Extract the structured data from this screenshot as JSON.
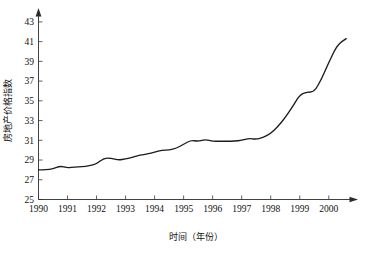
{
  "chart_data": {
    "type": "line",
    "title": "",
    "xlabel": "时间（年份）",
    "ylabel": "房地产价格指数",
    "xlim": [
      1990,
      2000.8
    ],
    "ylim": [
      25,
      43.8
    ],
    "grid": false,
    "legend": null,
    "x_tick_labels": [
      "1990",
      "1991",
      "1992",
      "1993",
      "1994",
      "1995",
      "1996",
      "1997",
      "1998",
      "1999",
      "2000"
    ],
    "x_ticks": [
      1990,
      1991,
      1992,
      1993,
      1994,
      1995,
      1996,
      1997,
      1998,
      1999,
      2000
    ],
    "y_tick_labels": [
      "25",
      "27",
      "29",
      "31",
      "33",
      "35",
      "37",
      "39",
      "41",
      "43"
    ],
    "y_ticks": [
      25,
      27,
      29,
      31,
      33,
      35,
      37,
      39,
      41,
      43
    ],
    "series": [
      {
        "name": "房地产价格指数",
        "x": [
          1990.0,
          1990.25,
          1990.5,
          1990.75,
          1991.0,
          1991.25,
          1991.5,
          1991.75,
          1992.0,
          1992.25,
          1992.5,
          1992.75,
          1993.0,
          1993.25,
          1993.5,
          1993.75,
          1994.0,
          1994.25,
          1994.5,
          1994.75,
          1995.0,
          1995.25,
          1995.5,
          1995.75,
          1996.0,
          1996.25,
          1996.5,
          1996.75,
          1997.0,
          1997.25,
          1997.5,
          1997.75,
          1998.0,
          1998.25,
          1998.5,
          1998.75,
          1999.0,
          1999.25,
          1999.5,
          1999.75,
          2000.0,
          2000.3,
          2000.6
        ],
        "values": [
          28.0,
          28.0,
          28.1,
          28.4,
          28.2,
          28.3,
          28.3,
          28.4,
          28.6,
          29.2,
          29.2,
          29.0,
          29.1,
          29.3,
          29.5,
          29.6,
          29.8,
          30.0,
          30.0,
          30.2,
          30.6,
          31.0,
          30.9,
          31.1,
          30.9,
          30.9,
          30.9,
          30.9,
          31.0,
          31.2,
          31.1,
          31.3,
          31.7,
          32.4,
          33.3,
          34.4,
          35.6,
          35.9,
          35.9,
          37.2,
          38.9,
          40.7,
          41.3
        ]
      }
    ]
  },
  "axes": {
    "y_axis_title": "房地产价格指数",
    "x_axis_title": "时间（年份）"
  },
  "artifacts": {
    "top_clipped_text": "· · ·   · ·"
  },
  "colors": {
    "line": "#1c1c1c",
    "axis": "#2b2b2b",
    "text": "#111111",
    "background": "#ffffff"
  }
}
